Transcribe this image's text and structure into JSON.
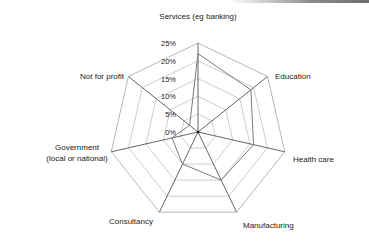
{
  "chart_data": {
    "type": "radar",
    "title": "",
    "categories": [
      "Services (eg banking)",
      "Education",
      "Health care",
      "Manufacturing",
      "Consultancy",
      "Government (local or national)",
      "Not for profit"
    ],
    "category_lines": [
      [
        "Services (eg banking)"
      ],
      [
        "Education"
      ],
      [
        "Health care"
      ],
      [
        "Manufacturing"
      ],
      [
        "Consultancy"
      ],
      [
        "Government",
        "(local or national)"
      ],
      [
        "Not for profit"
      ]
    ],
    "series": [
      {
        "name": "Series 1",
        "values": [
          22,
          19,
          16,
          15,
          10,
          7.5,
          3
        ]
      }
    ],
    "radial_ticks": [
      0,
      5,
      10,
      15,
      20,
      25
    ],
    "radial_tick_labels": [
      "0%",
      "5%",
      "10%",
      "15%",
      "20%",
      "25%"
    ],
    "range": [
      0,
      25
    ],
    "grid": true,
    "legend": "none",
    "colors": {
      "grid": "#b8b8b8",
      "axis": "#555555",
      "series": "#7a7a7a",
      "text": "#222222"
    }
  }
}
